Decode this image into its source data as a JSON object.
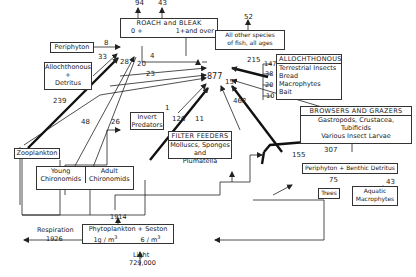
{
  "nodes": {
    "roach_bleak": {
      "title": "ROACH and BLEAK",
      "age_young": "0 +",
      "age_old": "1+and  over"
    },
    "other_species": {
      "line1": "All other species",
      "line2": "of fish, all ages"
    },
    "total": "877",
    "periphyton": "Periphyton",
    "allochthonous_detritus": {
      "line1": "Allochthonous",
      "line2": "+",
      "line3": "Detritus"
    },
    "allochthonous": {
      "title": "ALLOCHTHONOUS",
      "items": [
        "Terrestrial Insects",
        "Bread",
        "Macrophytes",
        "Bait"
      ],
      "values": [
        "147",
        "38",
        "20",
        "10"
      ]
    },
    "invert_predators": {
      "line1": "Invert",
      "line2": "Predators"
    },
    "browsers_grazers": {
      "title": "BROWSERS AND GRAZERS",
      "line1": "Gastropods, Crustacea,",
      "line2": "Tubificids",
      "line3": "Various   Insect   Larvae"
    },
    "zooplankton": "Zooplankton",
    "filter_feeders": {
      "title": "FILTER FEEDERS",
      "line1": "Molluscs, Sponges and",
      "line2": "Plumatella"
    },
    "young_chironomids": {
      "line1": "Young",
      "line2": "Chironomids"
    },
    "adult_chironomids": {
      "line1": "Adult",
      "line2": "Chironomids"
    },
    "periphyton_benthic": "Periphyton + Benthic Detritus",
    "trees": "Trees",
    "aquatic_macrophytes": {
      "line1": "Aquatic",
      "line2": "Macrophytes"
    },
    "phytoplankton": {
      "title": "Phytoplankton + Seston",
      "conc1": "1g / m",
      "conc2": "6 / m",
      "exp": "3"
    },
    "respiration": {
      "label": "Respiration",
      "value": "1926"
    },
    "light": {
      "label": "Light",
      "value": "729,000"
    }
  },
  "flows": {
    "roach_young_out": "94",
    "roach_old_out": "43",
    "other_out": "52",
    "periphyton_to_roach": "8",
    "detritus_to_roach": "33",
    "zooplankton_to_total": "239",
    "young_to_total": "48",
    "adult_to_total": "26",
    "roach_young_to_total": "4",
    "flow_28": "28",
    "flow_20": "20",
    "flow_23": "23",
    "invert_to_total": "1",
    "flow_126": "126",
    "filter_to_total": "11",
    "allochthonous_to_total": "215",
    "browsers_to_total": "15",
    "benthic_to_total": "462",
    "benthic_to_browsers": "307",
    "flow_155": "155",
    "trees_to_benthic": "75",
    "macrophytes_to_benthic": "43",
    "phyto_to_consumers": "1914"
  }
}
